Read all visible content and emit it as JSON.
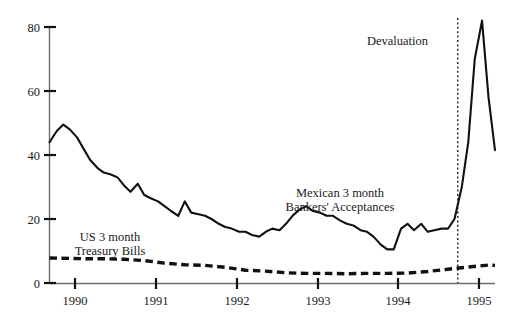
{
  "chart_data": {
    "type": "line",
    "title": "",
    "subtitle": "",
    "xlabel": "",
    "ylabel": "",
    "xlim": [
      1989.58,
      1995.08
    ],
    "ylim": [
      0,
      84
    ],
    "yticks": [
      0,
      20,
      40,
      60,
      80
    ],
    "ytick_labels": [
      "0",
      "20",
      "40",
      "60",
      "80"
    ],
    "xticks": [
      1990,
      1991,
      1992,
      1993,
      1994,
      1995
    ],
    "xtick_labels": [
      "1990",
      "1991",
      "1992",
      "1993",
      "1994",
      "1995"
    ],
    "grid": false,
    "legend_position": "inline-annotations",
    "series": [
      {
        "name": "Mexican 3 month Bankers' Acceptances",
        "style": "solid",
        "color": "#111111",
        "label_text": [
          "Mexican 3 month",
          "Bankers' Acceptances"
        ],
        "x": [
          1989.58,
          1989.67,
          1989.75,
          1989.83,
          1989.92,
          1990.0,
          1990.08,
          1990.17,
          1990.25,
          1990.33,
          1990.42,
          1990.5,
          1990.58,
          1990.67,
          1990.75,
          1990.83,
          1990.92,
          1991.0,
          1991.08,
          1991.17,
          1991.25,
          1991.33,
          1991.42,
          1991.5,
          1991.58,
          1991.67,
          1991.75,
          1991.83,
          1991.92,
          1992.0,
          1992.08,
          1992.17,
          1992.25,
          1992.33,
          1992.42,
          1992.5,
          1992.58,
          1992.67,
          1992.75,
          1992.83,
          1992.92,
          1993.0,
          1993.08,
          1993.17,
          1993.25,
          1993.33,
          1993.42,
          1993.5,
          1993.58,
          1993.67,
          1993.75,
          1993.83,
          1993.92,
          1994.0,
          1994.08,
          1994.17,
          1994.25,
          1994.33,
          1994.42,
          1994.5,
          1994.58,
          1994.67,
          1994.75,
          1994.83,
          1994.92,
          1995.0,
          1995.08
        ],
        "values": [
          44.0,
          47.5,
          49.5,
          48.0,
          45.5,
          42.0,
          38.5,
          36.0,
          34.5,
          34.0,
          33.0,
          30.5,
          28.5,
          31.0,
          27.5,
          26.5,
          25.5,
          24.0,
          22.5,
          21.0,
          25.5,
          22.0,
          21.5,
          21.0,
          20.0,
          18.5,
          17.5,
          17.0,
          16.0,
          16.0,
          15.0,
          14.5,
          16.0,
          17.0,
          16.5,
          18.5,
          21.0,
          23.0,
          24.0,
          22.5,
          22.0,
          21.0,
          21.0,
          19.5,
          18.5,
          18.0,
          16.5,
          16.0,
          14.5,
          12.0,
          10.5,
          10.5,
          17.0,
          18.5,
          16.5,
          18.5,
          16.0,
          16.5,
          17.0,
          17.0,
          20.0,
          30.0,
          44.0,
          70.0,
          82.0,
          58.0,
          41.5
        ],
        "peak_value": 82.0,
        "peak_x": 1994.92,
        "start_value": 44.0,
        "end_value": 41.5
      },
      {
        "name": "US 3 month Treasury Bills",
        "style": "dashed",
        "color": "#111111",
        "label_text": [
          "US 3 month",
          "Treasury Bills"
        ],
        "x": [
          1989.58,
          1989.83,
          1990.0,
          1990.25,
          1990.5,
          1990.75,
          1991.0,
          1991.25,
          1991.5,
          1991.75,
          1992.0,
          1992.25,
          1992.5,
          1992.75,
          1993.0,
          1993.25,
          1993.5,
          1993.75,
          1994.0,
          1994.25,
          1994.5,
          1994.75,
          1995.0,
          1995.08
        ],
        "values": [
          7.8,
          7.7,
          7.6,
          7.6,
          7.4,
          7.0,
          6.2,
          5.7,
          5.5,
          4.9,
          4.0,
          3.7,
          3.2,
          3.0,
          3.0,
          2.9,
          3.0,
          3.0,
          3.1,
          3.6,
          4.3,
          5.0,
          5.6,
          5.5
        ],
        "start_value": 7.8,
        "end_value": 5.5
      }
    ],
    "annotations": [
      {
        "name": "devaluation-marker",
        "label": "Devaluation",
        "x": 1994.62,
        "line_style": "dotted-vertical",
        "label_position": "left-of-line",
        "label_y_value": 72
      }
    ]
  },
  "axes": {
    "y_tick_0": "0",
    "y_tick_20": "20",
    "y_tick_40": "40",
    "y_tick_60": "60",
    "y_tick_80": "80",
    "x_tick_1990": "1990",
    "x_tick_1991": "1991",
    "x_tick_1992": "1992",
    "x_tick_1993": "1993",
    "x_tick_1994": "1994",
    "x_tick_1995": "1995"
  },
  "labels": {
    "mexican_line1": "Mexican 3 month",
    "mexican_line2": "Bankers' Acceptances",
    "us_line1": "US 3 month",
    "us_line2": "Treasury Bills",
    "devaluation": "Devaluation"
  }
}
